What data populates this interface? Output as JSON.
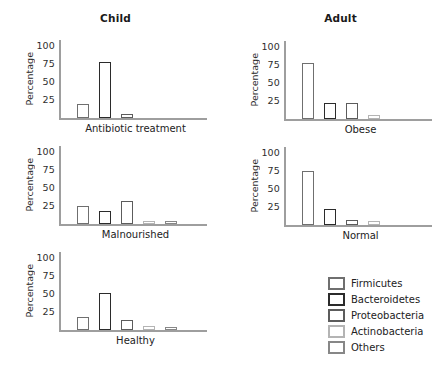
{
  "figure": {
    "column_titles": {
      "left": "Child",
      "right": "Adult"
    }
  },
  "colors": {
    "axis": "#9e9e9e",
    "text": "#2a2a2a",
    "series": {
      "Firmicutes": "#6f6f6f",
      "Bacteroidetes": "#2b2b2b",
      "Proteobacteria": "#5c5c5c",
      "Actinobacteria": "#b4b4b4",
      "Others": "#878787"
    }
  },
  "legend": {
    "position": "bottom-right",
    "entries": [
      "Firmicutes",
      "Bacteroidetes",
      "Proteobacteria",
      "Actinobacteria",
      "Others"
    ]
  },
  "chart_data": [
    {
      "type": "bar",
      "title": "Antibiotic treatment",
      "group": "Child",
      "categories": [
        "Firmicutes",
        "Bacteroidetes",
        "Proteobacteria",
        "Actinobacteria",
        "Others"
      ],
      "values": [
        20,
        78,
        5,
        0,
        0
      ],
      "xlabel": "Antibiotic treatment",
      "ylabel": "Percentage",
      "ylim": [
        0,
        100
      ],
      "yticks": [
        25,
        50,
        75,
        100
      ],
      "grid": false,
      "bar_fill": "white"
    },
    {
      "type": "bar",
      "title": "Obese",
      "group": "Adult",
      "categories": [
        "Firmicutes",
        "Bacteroidetes",
        "Proteobacteria",
        "Actinobacteria",
        "Others"
      ],
      "values": [
        78,
        22,
        22,
        6,
        0
      ],
      "xlabel": "Obese",
      "ylabel": "Percentage",
      "ylim": [
        0,
        100
      ],
      "yticks": [
        25,
        50,
        75,
        100
      ],
      "grid": false,
      "bar_fill": "white"
    },
    {
      "type": "bar",
      "title": "Malnourished",
      "group": "Child",
      "categories": [
        "Firmicutes",
        "Bacteroidetes",
        "Proteobacteria",
        "Actinobacteria",
        "Others"
      ],
      "values": [
        25,
        18,
        32,
        4,
        4
      ],
      "xlabel": "Malnourished",
      "ylabel": "Percentage",
      "ylim": [
        0,
        100
      ],
      "yticks": [
        25,
        50,
        75,
        100
      ],
      "grid": false,
      "bar_fill": "white"
    },
    {
      "type": "bar",
      "title": "Normal",
      "group": "Adult",
      "categories": [
        "Firmicutes",
        "Bacteroidetes",
        "Proteobacteria",
        "Actinobacteria",
        "Others"
      ],
      "values": [
        75,
        22,
        7,
        5,
        0
      ],
      "xlabel": "Normal",
      "ylabel": "Percentage",
      "ylim": [
        0,
        100
      ],
      "yticks": [
        25,
        50,
        75,
        100
      ],
      "grid": false,
      "bar_fill": "white"
    },
    {
      "type": "bar",
      "title": "Healthy",
      "group": "Child",
      "categories": [
        "Firmicutes",
        "Bacteroidetes",
        "Proteobacteria",
        "Actinobacteria",
        "Others"
      ],
      "values": [
        18,
        52,
        14,
        5,
        3
      ],
      "xlabel": "Healthy",
      "ylabel": "Percentage",
      "ylim": [
        0,
        100
      ],
      "yticks": [
        25,
        50,
        75,
        100
      ],
      "grid": false,
      "bar_fill": "white"
    }
  ]
}
